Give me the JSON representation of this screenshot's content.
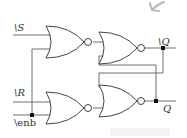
{
  "diagram": {
    "inputs": [
      {
        "name": "S_bar",
        "label_prefix": "\\",
        "label": "S"
      },
      {
        "name": "R_bar",
        "label_prefix": "\\",
        "label": "R"
      },
      {
        "name": "enb_bar",
        "label": "\\enb"
      }
    ],
    "outputs": [
      {
        "name": "Q_bar",
        "label_prefix": "\\",
        "label": "Q"
      },
      {
        "name": "Q",
        "label": "Q"
      }
    ],
    "gates": [
      {
        "id": "g1",
        "type": "NOR",
        "inputs": [
          "S_bar",
          "enb_bar"
        ]
      },
      {
        "id": "g2",
        "type": "NOR",
        "inputs": [
          "g1",
          "Q"
        ],
        "output": "Q_bar"
      },
      {
        "id": "g3",
        "type": "NOR",
        "inputs": [
          "R_bar",
          "enb_bar"
        ]
      },
      {
        "id": "g4",
        "type": "NOR",
        "inputs": [
          "Q_bar",
          "g3"
        ],
        "output": "Q"
      }
    ],
    "annotation": {
      "type": "pen-stroke-arrow",
      "color": "#b0b0b0"
    }
  }
}
